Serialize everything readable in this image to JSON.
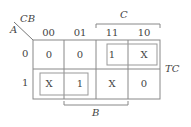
{
  "kmap": {
    "corner_top": "CB",
    "corner_left": "A",
    "col_headers": [
      "00",
      "01",
      "11",
      "10"
    ],
    "row_headers": [
      "0",
      "1"
    ],
    "cells": [
      [
        "0",
        "0",
        "1",
        "X"
      ],
      [
        "X",
        "1",
        "X",
        "0"
      ]
    ],
    "bracket_top": "C",
    "bracket_bottom": "B",
    "output_label": "TC"
  },
  "colors": {
    "line": "#777777",
    "text": "#444444"
  }
}
